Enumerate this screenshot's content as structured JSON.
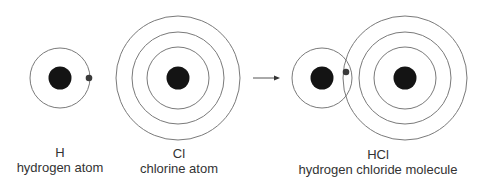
{
  "diagram": {
    "colors": {
      "nucleus": "#141414",
      "shell": "#7a7a7a",
      "hydrogen_electron": "#3a3a3a",
      "chlorine_electron": "#3c3c3c",
      "text": "#333333"
    },
    "arrow": {
      "direction": "right",
      "meaning": "reacts to form"
    },
    "hydrogen_atom": {
      "symbol": "H",
      "name": "hydrogen atom",
      "shells": 1,
      "electron_configuration": [
        1
      ],
      "electron_marker": "dot"
    },
    "chlorine_atom": {
      "symbol": "Cl",
      "name": "chlorine atom",
      "shells": 3,
      "electron_configuration": [
        2,
        8,
        7
      ],
      "electron_marker": "cross"
    },
    "hcl_molecule": {
      "symbol": "HCl",
      "name": "hydrogen chloride molecule",
      "shared_pair": [
        "dot (from H)",
        "cross (from Cl)"
      ],
      "chlorine_outer_shell_electrons": 8
    }
  }
}
